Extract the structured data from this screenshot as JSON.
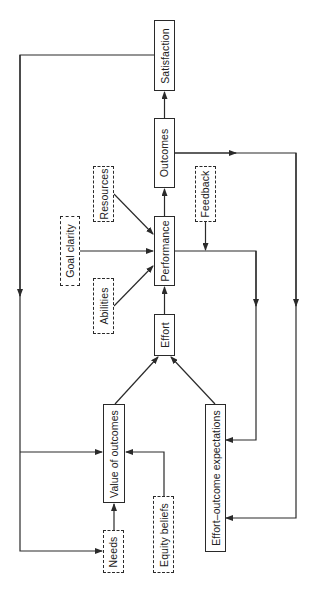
{
  "diagram": {
    "orientation": "rotated-90-ccw",
    "nodes": {
      "satisfaction": {
        "label": "Satisfaction",
        "style": "solid"
      },
      "outcomes": {
        "label": "Outcomes",
        "style": "solid"
      },
      "performance": {
        "label": "Performance",
        "style": "solid"
      },
      "effort": {
        "label": "Effort",
        "style": "solid"
      },
      "value_of_outcomes": {
        "label": "Value of outcomes",
        "style": "solid"
      },
      "effort_outcome_expectations": {
        "label": "Effort–outcome expectations",
        "style": "solid"
      },
      "resources": {
        "label": "Resources",
        "style": "dashed"
      },
      "goal_clarity": {
        "label": "Goal clarity",
        "style": "dashed"
      },
      "abilities": {
        "label": "Abilities",
        "style": "dashed"
      },
      "feedback": {
        "label": "Feedback",
        "style": "dashed"
      },
      "needs": {
        "label": "Needs",
        "style": "dashed"
      },
      "equity_beliefs": {
        "label": "Equity beliefs",
        "style": "dashed"
      }
    },
    "edges": [
      {
        "from": "needs",
        "to": "value_of_outcomes"
      },
      {
        "from": "equity_beliefs",
        "to": "value_of_outcomes"
      },
      {
        "from": "value_of_outcomes",
        "to": "effort"
      },
      {
        "from": "effort_outcome_expectations",
        "to": "effort"
      },
      {
        "from": "effort",
        "to": "performance"
      },
      {
        "from": "resources",
        "to": "performance"
      },
      {
        "from": "goal_clarity",
        "to": "performance"
      },
      {
        "from": "abilities",
        "to": "performance"
      },
      {
        "from": "performance",
        "to": "outcomes"
      },
      {
        "from": "outcomes",
        "to": "satisfaction"
      },
      {
        "from": "satisfaction",
        "to": "value_of_outcomes"
      },
      {
        "from": "satisfaction",
        "to": "needs"
      },
      {
        "from": "performance",
        "to": "effort_outcome_expectations"
      },
      {
        "from": "feedback",
        "to": "performance_feedback_line"
      },
      {
        "from": "outcomes",
        "to": "effort_outcome_expectations"
      }
    ],
    "colors": {
      "line": "#2a2a2a",
      "background": "#ffffff"
    }
  }
}
